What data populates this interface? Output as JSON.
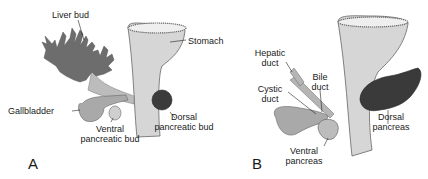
{
  "figure": {
    "panels": [
      {
        "id": "A",
        "letter": "A",
        "labels": {
          "liver_bud": "Liver bud",
          "stomach": "Stomach",
          "gallbladder": "Gallbladder",
          "ventral_line1": "Ventral",
          "ventral_line2": "pancreatic bud",
          "dorsal_line1": "Dorsal",
          "dorsal_line2": "pancreatic bud"
        }
      },
      {
        "id": "B",
        "letter": "B",
        "labels": {
          "hepatic_line1": "Hepatic",
          "hepatic_line2": "duct",
          "cystic_line1": "Cystic",
          "cystic_line2": "duct",
          "bile_line1": "Bile",
          "bile_line2": "duct",
          "dorsal_line1": "Dorsal",
          "dorsal_line2": "pancreas",
          "ventral_line1": "Ventral",
          "ventral_line2": "pancreas"
        }
      }
    ],
    "colors": {
      "gut_tube": "#d4d4d4",
      "liver": "#6e6e6e",
      "gallbladder": "#a8a8a8",
      "dorsal_bud": "#3a3a3a",
      "ventral_bud": "#bdbdbd",
      "outline": "#555555"
    }
  }
}
